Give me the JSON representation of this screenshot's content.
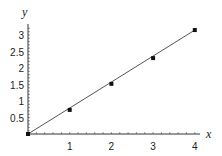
{
  "chart_data": {
    "type": "scatter",
    "title": "",
    "xlabel": "x",
    "ylabel": "y",
    "xlim": [
      0,
      4
    ],
    "ylim": [
      0,
      3.2
    ],
    "grid": false,
    "x_ticks": [
      "1",
      "2",
      "3",
      "4"
    ],
    "y_ticks": [
      "0.5",
      "1",
      "1.5",
      "2",
      "2.5",
      "3"
    ],
    "series": [
      {
        "name": "data points",
        "kind": "scatter",
        "x": [
          0,
          1,
          2,
          3,
          4
        ],
        "y": [
          0,
          0.73,
          1.52,
          2.3,
          3.15
        ]
      },
      {
        "name": "fitted line",
        "kind": "line",
        "x": [
          0,
          4
        ],
        "y": [
          0,
          3.15
        ]
      }
    ],
    "colors": {
      "line": "#555555",
      "points": "#111111",
      "axes": "#333333"
    }
  }
}
